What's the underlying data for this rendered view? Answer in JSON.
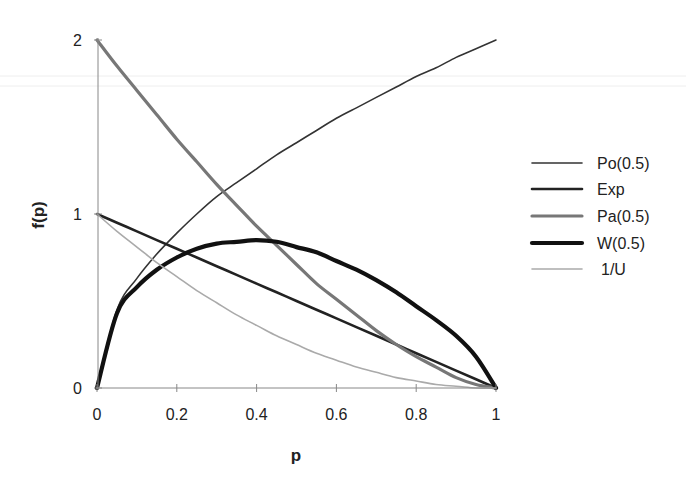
{
  "chart_data": {
    "type": "line",
    "title": "",
    "xlabel": "p",
    "ylabel": "f(p)",
    "xlim": [
      0,
      1
    ],
    "ylim": [
      0,
      2
    ],
    "grid": false,
    "legend_position": "right",
    "x_ticks": [
      "0",
      "0.2",
      "0.4",
      "0.6",
      "0.8",
      "1"
    ],
    "y_ticks": [
      "0",
      "1",
      "2"
    ],
    "x": [
      0,
      0.05,
      0.1,
      0.15,
      0.2,
      0.25,
      0.3,
      0.35,
      0.4,
      0.45,
      0.5,
      0.55,
      0.6,
      0.65,
      0.7,
      0.75,
      0.8,
      0.85,
      0.9,
      0.95,
      1
    ],
    "series": [
      {
        "name": "Po(0.5)",
        "color": "#333333",
        "width": 1.6,
        "values": [
          0,
          0.45,
          0.63,
          0.77,
          0.89,
          1.0,
          1.1,
          1.18,
          1.26,
          1.34,
          1.41,
          1.48,
          1.55,
          1.61,
          1.67,
          1.73,
          1.79,
          1.84,
          1.9,
          1.95,
          2.0
        ]
      },
      {
        "name": "Exp",
        "color": "#222222",
        "width": 2.6,
        "values": [
          1.0,
          0.95,
          0.9,
          0.85,
          0.8,
          0.75,
          0.7,
          0.65,
          0.6,
          0.55,
          0.5,
          0.45,
          0.4,
          0.35,
          0.3,
          0.25,
          0.2,
          0.15,
          0.1,
          0.05,
          0
        ]
      },
      {
        "name": "Pa(0.5)",
        "color": "#777777",
        "width": 3.2,
        "values": [
          2.0,
          1.85,
          1.71,
          1.57,
          1.43,
          1.3,
          1.17,
          1.05,
          0.93,
          0.82,
          0.71,
          0.6,
          0.51,
          0.42,
          0.33,
          0.25,
          0.18,
          0.12,
          0.06,
          0.02,
          0
        ]
      },
      {
        "name": "W(0.5)",
        "color": "#111111",
        "width": 4.2,
        "values": [
          0,
          0.43,
          0.58,
          0.68,
          0.75,
          0.8,
          0.83,
          0.84,
          0.85,
          0.84,
          0.81,
          0.78,
          0.73,
          0.68,
          0.62,
          0.55,
          0.47,
          0.39,
          0.3,
          0.18,
          0
        ]
      },
      {
        "name": "1/U",
        "color": "#aaaaaa",
        "width": 1.6,
        "values": [
          1.0,
          0.9,
          0.81,
          0.72,
          0.64,
          0.56,
          0.49,
          0.42,
          0.36,
          0.3,
          0.25,
          0.2,
          0.16,
          0.12,
          0.09,
          0.06,
          0.04,
          0.02,
          0.01,
          0.0,
          0
        ]
      }
    ]
  }
}
